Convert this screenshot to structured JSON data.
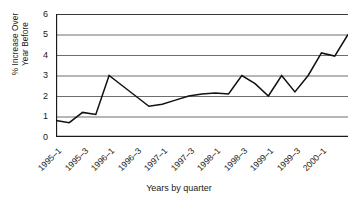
{
  "chart_data": {
    "type": "line",
    "title": "",
    "xlabel": "Years by quarter",
    "ylabel": "% Increase Over\nYear Before",
    "ylim": [
      0,
      6
    ],
    "yticks": [
      0,
      1,
      2,
      3,
      4,
      5,
      6
    ],
    "grid": "horizontal",
    "legend": "none",
    "x_tick_labels": [
      "1995–1",
      "1995–3",
      "1996–1",
      "1996–3",
      "1997–1",
      "1997–3",
      "1998–1",
      "1998–3",
      "1999–1",
      "1999–3",
      "2000–1"
    ],
    "x_tick_label_interval": 2,
    "n_ticks": 23,
    "series": [
      {
        "name": "% Increase Over Year Before",
        "color": "#111111",
        "x": [
          "1995–1",
          "1995–2",
          "1995–3",
          "1995–4",
          "1996–1",
          "1996–2",
          "1996–3",
          "1996–4",
          "1997–1",
          "1997–2",
          "1997–3",
          "1997–4",
          "1998–1",
          "1998–2",
          "1998–3",
          "1998–4",
          "1999–1",
          "1999–2",
          "1999–3",
          "1999–4",
          "2000–1",
          "2000–2",
          "2000–3"
        ],
        "values": [
          0.8,
          0.7,
          1.2,
          1.1,
          3.0,
          2.5,
          2.0,
          1.5,
          1.6,
          1.8,
          2.0,
          2.1,
          2.15,
          2.1,
          3.0,
          2.6,
          2.0,
          3.0,
          2.2,
          3.0,
          4.1,
          3.95,
          5.0
        ]
      }
    ]
  },
  "axes": {
    "y_title_text": "% Increase Over\nYear Before",
    "x_title_text": "Years by quarter"
  }
}
